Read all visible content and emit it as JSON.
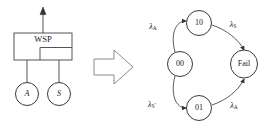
{
  "figure": {
    "left_block": {
      "system_box_label": "WSP",
      "output_arrow": "up-arrow",
      "components": [
        {
          "id": "comp-a",
          "label": "A"
        },
        {
          "id": "comp-s",
          "label": "S"
        }
      ]
    },
    "transform_arrow": {
      "icon": "block-arrow-right-icon"
    },
    "state_diagram": {
      "states": [
        {
          "id": "state-00",
          "label": "00",
          "shape": "circle",
          "cx": 52,
          "cy": 64
        },
        {
          "id": "state-10",
          "label": "10",
          "shape": "circle",
          "cx": 71,
          "cy": 23
        },
        {
          "id": "state-fail",
          "label": "Fail",
          "shape": "ellipse",
          "cx": 116,
          "cy": 64
        },
        {
          "id": "state-01",
          "label": "01",
          "shape": "circle",
          "cx": 71,
          "cy": 108
        }
      ],
      "transitions": [
        {
          "id": "t-00-10",
          "from": "00",
          "to": "10",
          "rate": "λ",
          "sub": "A",
          "prime": "",
          "label_x": 25,
          "label_y": 27
        },
        {
          "id": "t-10-fail",
          "from": "10",
          "to": "Fail",
          "rate": "λ",
          "sub": "S",
          "prime": "",
          "label_x": 105,
          "label_y": 25
        },
        {
          "id": "t-00-01",
          "from": "00",
          "to": "01",
          "rate": "λ",
          "sub": "S",
          "prime": "′",
          "label_x": 24,
          "label_y": 105
        },
        {
          "id": "t-01-fail",
          "from": "01",
          "to": "Fail",
          "rate": "λ",
          "sub": "A",
          "prime": "",
          "label_x": 106,
          "label_y": 106
        }
      ]
    },
    "colors": {
      "stroke": "#555555",
      "node_stroke": "#3a3a3a",
      "arc_stroke": "#4a4a4a",
      "big_arrow_stroke": "#8a8a8a",
      "text": "#1a1a1a",
      "background": "#ffffff"
    }
  }
}
